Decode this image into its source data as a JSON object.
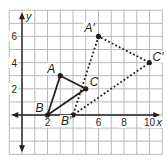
{
  "diagram": {
    "type": "coordinate-plane-transformation",
    "grid": {
      "x_min": -1,
      "x_max": 11,
      "y_min": -3,
      "y_max": 8,
      "step": 1
    },
    "axes": {
      "x_label": "x",
      "y_label": "y"
    },
    "x_ticks": [
      {
        "value": 2,
        "label": "2"
      },
      {
        "value": 6,
        "label": "6"
      },
      {
        "value": 8,
        "label": "8"
      },
      {
        "value": 10,
        "label": "10"
      }
    ],
    "y_ticks": [
      {
        "value": 2,
        "label": "2"
      },
      {
        "value": 4,
        "label": "4"
      },
      {
        "value": 6,
        "label": "6"
      }
    ],
    "preimage": {
      "style": "solid",
      "vertices": [
        {
          "name": "A",
          "x": 3,
          "y": 3
        },
        {
          "name": "B",
          "x": 2,
          "y": 0
        },
        {
          "name": "C",
          "x": 5,
          "y": 2
        }
      ]
    },
    "image": {
      "style": "dotted",
      "vertices": [
        {
          "name": "A′",
          "x": 6,
          "y": 6
        },
        {
          "name": "B′",
          "x": 4,
          "y": 0
        },
        {
          "name": "C′",
          "x": 10,
          "y": 4
        }
      ]
    },
    "colors": {
      "grid": "#b8b8b8",
      "ink": "#231f20",
      "background": "#ffffff"
    }
  }
}
